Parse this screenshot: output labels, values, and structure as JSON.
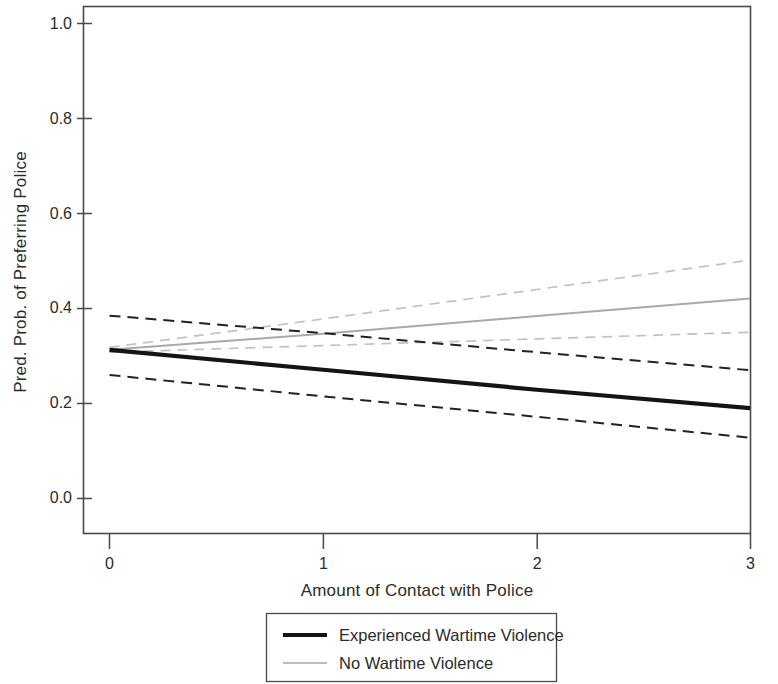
{
  "chart_data": {
    "type": "line",
    "title": "",
    "xlabel": "Amount of Contact with Police",
    "ylabel": "Pred. Prob. of Preferring Police",
    "xlim": [
      0,
      3
    ],
    "ylim": [
      0.0,
      1.0
    ],
    "xticks": [
      0,
      1,
      2,
      3
    ],
    "xtick_labels": [
      "0",
      "1",
      "2",
      "3"
    ],
    "yticks": [
      0.0,
      0.2,
      0.4,
      0.6,
      0.8,
      1.0
    ],
    "ytick_labels": [
      "0.0",
      "0.2",
      "0.4",
      "0.6",
      "0.8",
      "1.0"
    ],
    "grid": false,
    "legend_position": "below-axes",
    "x": [
      0,
      1,
      2,
      3
    ],
    "series": [
      {
        "name": "Experienced Wartime Violence",
        "style": "solid",
        "color": "#141414",
        "width": 4.2,
        "values": [
          0.313,
          0.271,
          0.229,
          0.19
        ]
      },
      {
        "name": "Experienced Wartime Violence upper CI",
        "style": "dashed",
        "color": "#222222",
        "width": 2.0,
        "values": [
          0.385,
          0.348,
          0.308,
          0.27
        ]
      },
      {
        "name": "Experienced Wartime Violence lower CI",
        "style": "dashed",
        "color": "#222222",
        "width": 2.0,
        "values": [
          0.26,
          0.215,
          0.172,
          0.128
        ]
      },
      {
        "name": "No Wartime Violence",
        "style": "solid",
        "color": "#a9a9a9",
        "width": 2.0,
        "values": [
          0.313,
          0.347,
          0.384,
          0.421
        ]
      },
      {
        "name": "No Wartime Violence upper CI",
        "style": "dashed",
        "color": "#c2c2c2",
        "width": 1.7,
        "values": [
          0.318,
          0.378,
          0.44,
          0.502
        ]
      },
      {
        "name": "No Wartime Violence lower CI",
        "style": "dashed",
        "color": "#c2c2c2",
        "width": 1.7,
        "values": [
          0.308,
          0.322,
          0.336,
          0.35
        ]
      }
    ],
    "legend": [
      {
        "label": "Experienced Wartime Violence",
        "style": "solid",
        "color": "#141414"
      },
      {
        "label": "No Wartime Violence",
        "style": "solid",
        "color": "#bdbdbd"
      }
    ]
  }
}
